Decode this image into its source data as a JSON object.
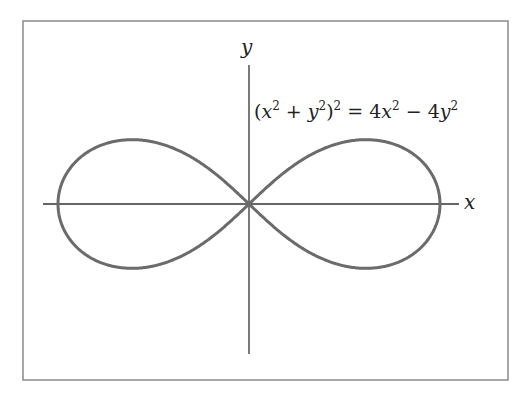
{
  "figure": {
    "equation": "(x² + y²)² = 4x² − 4y²",
    "equation_parts": {
      "lhs_open": "(",
      "x": "x",
      "sq": "2",
      "plus": " + ",
      "y": "y",
      "close": ")",
      "eq": " = 4",
      "minus": " − 4"
    },
    "x_axis_label": "x",
    "y_axis_label": "y",
    "colors": {
      "frame": "#8a8a8a",
      "axes": "#333333",
      "curve": "#6b6b6b"
    }
  },
  "chart_data": {
    "type": "line",
    "xlabel": "x",
    "ylabel": "y",
    "curve": "lemniscate",
    "parameters": {
      "a": 2
    },
    "xlim": [
      -2.2,
      2.2
    ],
    "ylim": [
      -1.6,
      1.6
    ],
    "x_intercepts": [
      -2,
      0,
      2
    ],
    "max_y": 0.707,
    "grid": false,
    "legend": "none"
  }
}
